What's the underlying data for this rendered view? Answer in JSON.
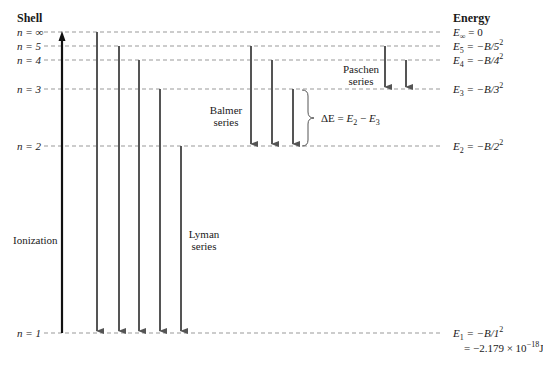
{
  "headers": {
    "shell": "Shell",
    "energy": "Energy"
  },
  "levels": [
    {
      "n_label": "n = ∞",
      "y": 32,
      "energy_var": "E",
      "energy_sub": "∞",
      "energy_rhs": " = 0",
      "energy_sup": ""
    },
    {
      "n_label": "n = 5",
      "y": 46,
      "energy_var": "E",
      "energy_sub": "5",
      "energy_rhs": " = −B/5",
      "energy_sup": "2"
    },
    {
      "n_label": "n = 4",
      "y": 60,
      "energy_var": "E",
      "energy_sub": "4",
      "energy_rhs": " = −B/4",
      "energy_sup": "2"
    },
    {
      "n_label": "n = 3",
      "y": 89,
      "energy_var": "E",
      "energy_sub": "3",
      "energy_rhs": " = −B/3",
      "energy_sup": "2"
    },
    {
      "n_label": "n = 2",
      "y": 146,
      "energy_var": "E",
      "energy_sub": "2",
      "energy_rhs": " = −B/2",
      "energy_sup": "2"
    },
    {
      "n_label": "n = 1",
      "y": 333,
      "energy_var": "E",
      "energy_sub": "1",
      "energy_rhs": " = −B/1",
      "energy_sup": "2"
    }
  ],
  "ground_value": {
    "prefix": "= −2.179 × 10",
    "exp": "−18",
    "unit": "J"
  },
  "series": {
    "ionization": {
      "label": "Ionization",
      "x": 62,
      "from_level": 1,
      "to_level": "∞"
    },
    "lyman": {
      "label_line1": "Lyman",
      "label_line2": "series",
      "arrows_x": [
        97,
        119,
        139,
        160,
        181
      ],
      "from_levels": [
        "∞",
        5,
        4,
        3,
        2
      ],
      "to_level": 1
    },
    "balmer": {
      "label_line1": "Balmer",
      "label_line2": "series",
      "arrows_x": [
        251,
        272,
        293
      ],
      "from_levels": [
        5,
        4,
        3
      ],
      "to_level": 2
    },
    "paschen": {
      "label_line1": "Paschen",
      "label_line2": "series",
      "arrows_x": [
        385,
        406
      ],
      "from_levels": [
        5,
        4
      ],
      "to_level": 3
    }
  },
  "delta_e": {
    "text_delta": "ΔE = ",
    "e_a": "E",
    "sub_a": "2",
    "minus": " − ",
    "e_b": "E",
    "sub_b": "3"
  },
  "colors": {
    "dashed": "#999999",
    "arrow": "#555555",
    "ionization": "#111111",
    "text": "#1a1a1a"
  }
}
